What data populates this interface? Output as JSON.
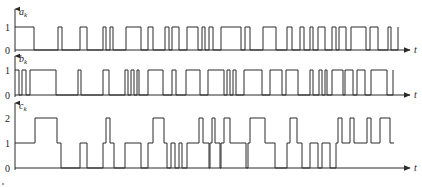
{
  "diagram": {
    "type": "digital waveform timing diagram",
    "time_axis_label": "t",
    "colors": {
      "stroke": "#2a2a2a",
      "background": "#ffffff"
    },
    "layout": {
      "x_origin": 15,
      "x_end": 410
    },
    "signals": [
      {
        "name": "a_k",
        "label_main": "a",
        "label_sub": "k",
        "levels": [
          0,
          1
        ],
        "level_y": {
          "0": 50,
          "1": 27
        },
        "initial_level": 1,
        "transitions": [
          [
            34,
            0
          ],
          [
            58,
            1
          ],
          [
            62,
            0
          ],
          [
            80,
            1
          ],
          [
            87,
            0
          ],
          [
            103,
            1
          ],
          [
            106,
            0
          ],
          [
            110,
            1
          ],
          [
            113,
            0
          ],
          [
            126,
            1
          ],
          [
            141,
            0
          ],
          [
            148,
            1
          ],
          [
            153,
            0
          ],
          [
            165,
            1
          ],
          [
            169,
            0
          ],
          [
            172,
            1
          ],
          [
            179,
            0
          ],
          [
            187,
            1
          ],
          [
            198,
            0
          ],
          [
            202,
            1
          ],
          [
            205,
            0
          ],
          [
            209,
            1
          ],
          [
            213,
            0
          ],
          [
            221,
            1
          ],
          [
            241,
            0
          ],
          [
            245,
            1
          ],
          [
            250,
            0
          ],
          [
            263,
            1
          ],
          [
            276,
            0
          ],
          [
            287,
            1
          ],
          [
            292,
            0
          ],
          [
            300,
            1
          ],
          [
            304,
            0
          ],
          [
            310,
            1
          ],
          [
            313,
            0
          ],
          [
            318,
            1
          ],
          [
            325,
            0
          ],
          [
            332,
            1
          ],
          [
            336,
            0
          ],
          [
            339,
            1
          ],
          [
            346,
            0
          ],
          [
            351,
            1
          ],
          [
            366,
            0
          ],
          [
            370,
            1
          ],
          [
            378,
            0
          ],
          [
            388,
            1
          ],
          [
            391,
            0
          ],
          [
            398,
            1
          ]
        ],
        "end_x": 398
      },
      {
        "name": "b_k",
        "label_main": "b",
        "label_sub": "k",
        "levels": [
          0,
          1
        ],
        "level_y": {
          "0": 95,
          "1": 70
        },
        "initial_level": 1,
        "transitions": [
          [
            19,
            0
          ],
          [
            22,
            1
          ],
          [
            26,
            0
          ],
          [
            30,
            1
          ],
          [
            56,
            0
          ],
          [
            78,
            1
          ],
          [
            81,
            0
          ],
          [
            103,
            1
          ],
          [
            109,
            0
          ],
          [
            125,
            1
          ],
          [
            128,
            0
          ],
          [
            131,
            1
          ],
          [
            134,
            0
          ],
          [
            137,
            1
          ],
          [
            139,
            0
          ],
          [
            148,
            1
          ],
          [
            163,
            0
          ],
          [
            172,
            1
          ],
          [
            176,
            0
          ],
          [
            186,
            1
          ],
          [
            200,
            0
          ],
          [
            208,
            1
          ],
          [
            224,
            0
          ],
          [
            227,
            1
          ],
          [
            230,
            0
          ],
          [
            233,
            1
          ],
          [
            236,
            0
          ],
          [
            244,
            1
          ],
          [
            262,
            0
          ],
          [
            270,
            1
          ],
          [
            282,
            0
          ],
          [
            286,
            1
          ],
          [
            298,
            0
          ],
          [
            310,
            1
          ],
          [
            313,
            0
          ],
          [
            319,
            1
          ],
          [
            322,
            0
          ],
          [
            325,
            1
          ],
          [
            327,
            0
          ],
          [
            332,
            1
          ],
          [
            343,
            0
          ],
          [
            345,
            1
          ],
          [
            353,
            0
          ],
          [
            357,
            1
          ],
          [
            365,
            0
          ],
          [
            371,
            1
          ],
          [
            387,
            0
          ],
          [
            393,
            1
          ]
        ],
        "end_x": 393
      },
      {
        "name": "c_k",
        "label_main": "c",
        "label_sub": "k",
        "levels": [
          0,
          1,
          2
        ],
        "level_y": {
          "0": 168,
          "1": 143,
          "2": 118
        },
        "initial_level": 1,
        "transitions": [
          [
            35,
            2
          ],
          [
            57,
            1
          ],
          [
            61,
            0
          ],
          [
            80,
            1
          ],
          [
            87,
            0
          ],
          [
            103,
            1
          ],
          [
            106,
            2
          ],
          [
            110,
            1
          ],
          [
            114,
            0
          ],
          [
            125,
            1
          ],
          [
            130,
            1
          ],
          [
            141,
            0
          ],
          [
            148,
            1
          ],
          [
            153,
            2
          ],
          [
            164,
            1
          ],
          [
            167,
            0
          ],
          [
            171,
            1
          ],
          [
            175,
            0
          ],
          [
            179,
            1
          ],
          [
            182,
            0
          ],
          [
            187,
            1
          ],
          [
            199,
            2
          ],
          [
            203,
            1
          ],
          [
            209,
            0
          ],
          [
            210,
            1
          ],
          [
            212,
            2
          ],
          [
            215,
            1
          ],
          [
            220,
            0
          ],
          [
            221,
            1
          ],
          [
            224,
            2
          ],
          [
            230,
            1
          ],
          [
            246,
            0
          ],
          [
            248,
            1
          ],
          [
            250,
            2
          ],
          [
            265,
            1
          ],
          [
            275,
            0
          ],
          [
            287,
            1
          ],
          [
            290,
            2
          ],
          [
            297,
            1
          ],
          [
            302,
            0
          ],
          [
            310,
            1
          ],
          [
            318,
            0
          ],
          [
            322,
            1
          ],
          [
            330,
            0
          ],
          [
            336,
            1
          ],
          [
            338,
            2
          ],
          [
            342,
            1
          ],
          [
            350,
            2
          ],
          [
            354,
            1
          ],
          [
            367,
            2
          ],
          [
            371,
            1
          ],
          [
            380,
            2
          ],
          [
            390,
            1
          ],
          [
            394,
            1
          ]
        ],
        "end_x": 394
      }
    ]
  }
}
